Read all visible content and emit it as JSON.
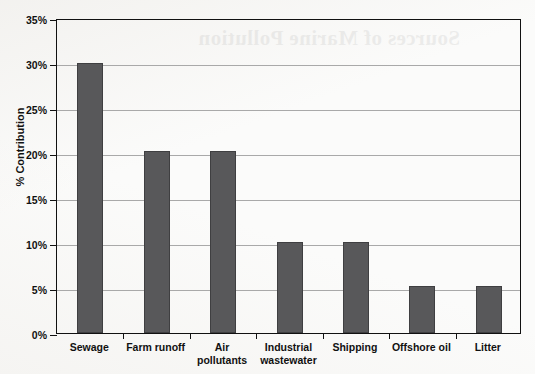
{
  "page": {
    "background_color": "#fbfbfa",
    "showthrough_text": "Sources of Marine Pollution"
  },
  "chart_data": {
    "type": "bar",
    "title": "",
    "subtitle": "",
    "xlabel": "",
    "ylabel": "% Contribution",
    "categories": [
      "Sewage",
      "Farm runoff",
      "Air pollutants",
      "Industrial wastewater",
      "Shipping",
      "Offshore oil",
      "Litter"
    ],
    "category_lines": [
      [
        "Sewage"
      ],
      [
        "Farm runoff"
      ],
      [
        "Air",
        "pollutants"
      ],
      [
        "Industrial",
        "wastewater"
      ],
      [
        "Shipping"
      ],
      [
        "Offshore oil"
      ],
      [
        "Litter"
      ]
    ],
    "values": [
      30,
      20.2,
      20.2,
      10.1,
      10.1,
      5.2,
      5.2
    ],
    "ylim": [
      0,
      35
    ],
    "ytick_values": [
      0,
      5,
      10,
      15,
      20,
      25,
      30,
      35
    ],
    "ytick_labels": [
      "0%",
      "5%",
      "10%",
      "15%",
      "20%",
      "25%",
      "30%",
      "35%"
    ],
    "grid": true,
    "grid_axis": "y",
    "legend": false,
    "legend_position": "none",
    "bar_color": "#58585a",
    "bar_edge_color": "#3f3f41",
    "grid_color": "#a9a9a9",
    "axis_color": "#111111"
  }
}
